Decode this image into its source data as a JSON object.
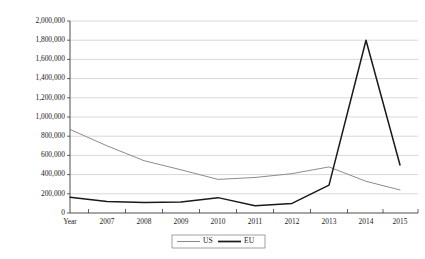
{
  "chart_data": {
    "type": "line",
    "title": "",
    "subtitle": "",
    "xlabel": "",
    "ylabel": "",
    "categories": [
      "Year",
      "2007",
      "2008",
      "2009",
      "2010",
      "2011",
      "2012",
      "2013",
      "2014",
      "2015"
    ],
    "series": [
      {
        "name": "US",
        "color": "#8c8c8c",
        "values": [
          870000,
          700000,
          545000,
          450000,
          350000,
          370000,
          410000,
          480000,
          330000,
          240000
        ]
      },
      {
        "name": "EU",
        "color": "#1a1a1a",
        "values": [
          165000,
          120000,
          110000,
          115000,
          160000,
          75000,
          100000,
          290000,
          1800000,
          500000
        ]
      }
    ],
    "ylim": [
      0,
      2000000
    ],
    "yticks": [
      0,
      200000,
      400000,
      600000,
      800000,
      1000000,
      1200000,
      1400000,
      1600000,
      1800000,
      2000000
    ],
    "ytick_labels": [
      "0",
      "200,000",
      "400,000",
      "600,000",
      "800,000",
      "1,000,000",
      "1,200,000",
      "1,400,000",
      "1,600,000",
      "1,800,000",
      "2,000,000"
    ],
    "grid": true,
    "legend_position": "bottom-center",
    "legend_entries": [
      "US",
      "EU"
    ],
    "background_color": "#ffffff",
    "gridline_color": "#c8c8c8",
    "axis_color": "#3a3a3a"
  }
}
